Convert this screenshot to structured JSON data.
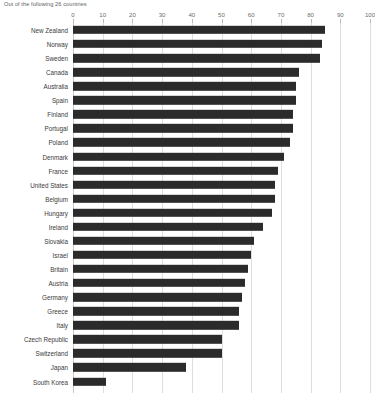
{
  "subtitle": "Out of the following 26 countries",
  "axis": {
    "ticks": [
      {
        "label": "0",
        "value": 0
      },
      {
        "label": "10",
        "value": 10
      },
      {
        "label": "20",
        "value": 20
      },
      {
        "label": "30",
        "value": 30
      },
      {
        "label": "40",
        "value": 40
      },
      {
        "label": "50",
        "value": 50
      },
      {
        "label": "60",
        "value": 60
      },
      {
        "label": "70",
        "value": 70
      },
      {
        "label": "80",
        "value": 80
      },
      {
        "label": "90",
        "value": 90
      },
      {
        "label": "100",
        "value": 100
      }
    ]
  },
  "colors": {
    "bar": "#2b2b2b",
    "gridline": "#dedede",
    "axis": "#c9c9c9",
    "label_text": "#3b3b3b",
    "tick_text": "#6d6d6d",
    "subtitle_text": "#5e5e5e",
    "background": "#ffffff"
  },
  "chart_data": {
    "type": "bar",
    "orientation": "horizontal",
    "title": "",
    "subtitle": "Out of the following 26 countries",
    "xlabel": "",
    "ylabel": "",
    "xlim": [
      0,
      100
    ],
    "xticks": [
      0,
      10,
      20,
      30,
      40,
      50,
      60,
      70,
      80,
      90,
      100
    ],
    "grid": true,
    "legend": false,
    "categories": [
      "New Zealand",
      "Norway",
      "Sweden",
      "Canada",
      "Australia",
      "Spain",
      "Finland",
      "Portugal",
      "Poland",
      "Denmark",
      "France",
      "United States",
      "Belgium",
      "Hungary",
      "Ireland",
      "Slovakia",
      "Israel",
      "Britain",
      "Austria",
      "Germany",
      "Greece",
      "Italy",
      "Czech Republic",
      "Switzerland",
      "Japan",
      "South Korea"
    ],
    "values": [
      85,
      84,
      83,
      76,
      75,
      75,
      74,
      74,
      73,
      71,
      69,
      68,
      68,
      67,
      64,
      61,
      60,
      59,
      58,
      57,
      56,
      56,
      50,
      50,
      38,
      11
    ]
  }
}
